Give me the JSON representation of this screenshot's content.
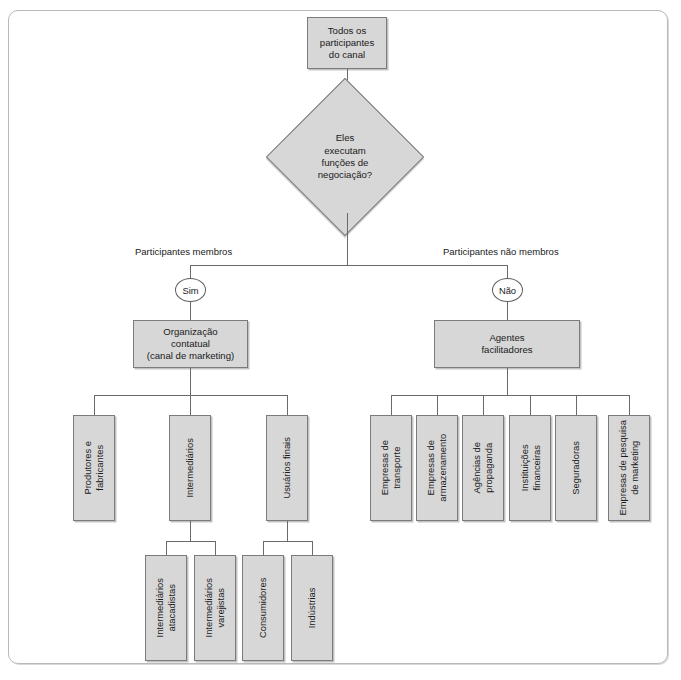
{
  "diagram": {
    "title_node": {
      "label": "Todos os\nparticipantes\ndo canal"
    },
    "decision": {
      "label": "Eles\nexecutam\nfunções de\nnegociação?"
    },
    "branch_labels": {
      "left": "Participantes membros",
      "right": "Participantes não membros"
    },
    "gates": {
      "yes": "Sim",
      "no": "Não"
    },
    "level2": {
      "left": "Organização\ncontatual\n(canal de marketing)",
      "right": "Agentes\nfacilitadores"
    },
    "left_children": [
      {
        "label": "Produtores e\nfabricantes"
      },
      {
        "label": "Intermediários"
      },
      {
        "label": "Usuários finais"
      }
    ],
    "left_grandchildren": [
      {
        "label": "Intermediários\natacadistas"
      },
      {
        "label": "Intermediários\nvarejistas"
      },
      {
        "label": "Consumidores"
      },
      {
        "label": "Indústrias"
      }
    ],
    "right_children": [
      {
        "label": "Empresas de\ntransporte"
      },
      {
        "label": "Empresas de\narmazenamento"
      },
      {
        "label": "Agências de\npropaganda"
      },
      {
        "label": "Instituições\nfinanceiras"
      },
      {
        "label": "Seguradoras"
      },
      {
        "label": "Empresas de pesquisa\nde marketing"
      }
    ],
    "colors": {
      "node_fill": "#d7d7d7",
      "node_border": "#7b7b7b",
      "line": "#6a6a6a",
      "frame_border": "#b9b9b9",
      "text": "#1a1a1a",
      "gate_fill": "#ffffff"
    }
  }
}
